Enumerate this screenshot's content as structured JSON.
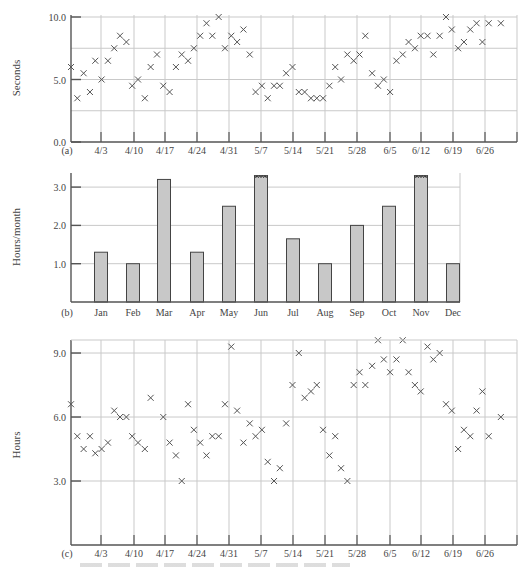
{
  "figure": {
    "caption_visible_text": ""
  },
  "chart_data": [
    {
      "panel": "(a)",
      "type": "scatter",
      "marker": "x",
      "title": "",
      "xlabel": "",
      "ylabel": "Seconds",
      "ylim": [
        0,
        10
      ],
      "yticks": [
        0.0,
        5.0,
        10.0
      ],
      "ytick_labels": [
        "0.0",
        "5.0",
        "10.0"
      ],
      "y_gridlines": [
        2.5,
        5.0,
        7.5,
        10.0
      ],
      "x_tick_labels": [
        "4/3",
        "4/10",
        "4/17",
        "4/24",
        "4/31",
        "5/7",
        "5/14",
        "5/21",
        "5/28",
        "6/5",
        "6/12",
        "6/19",
        "6/26"
      ],
      "x_range_days": [
        0,
        91
      ],
      "grid": true,
      "points": [
        {
          "day": 0,
          "y": 6.0
        },
        {
          "day": 1.3,
          "y": 3.5
        },
        {
          "day": 2.6,
          "y": 5.5
        },
        {
          "day": 3.9,
          "y": 4.0
        },
        {
          "day": 5.0,
          "y": 6.5
        },
        {
          "day": 6.3,
          "y": 5.0
        },
        {
          "day": 7.6,
          "y": 6.5
        },
        {
          "day": 8.9,
          "y": 7.5
        },
        {
          "day": 10.1,
          "y": 8.5
        },
        {
          "day": 11.4,
          "y": 8.0
        },
        {
          "day": 12.6,
          "y": 4.5
        },
        {
          "day": 13.8,
          "y": 5.0
        },
        {
          "day": 15.2,
          "y": 3.5
        },
        {
          "day": 16.4,
          "y": 6.0
        },
        {
          "day": 17.7,
          "y": 7.0
        },
        {
          "day": 19.0,
          "y": 4.5
        },
        {
          "day": 20.3,
          "y": 4.0
        },
        {
          "day": 21.6,
          "y": 6.0
        },
        {
          "day": 22.8,
          "y": 7.0
        },
        {
          "day": 24.1,
          "y": 6.5
        },
        {
          "day": 25.3,
          "y": 7.5
        },
        {
          "day": 26.6,
          "y": 8.5
        },
        {
          "day": 27.9,
          "y": 9.5
        },
        {
          "day": 29.1,
          "y": 8.5
        },
        {
          "day": 30.4,
          "y": 10.0
        },
        {
          "day": 31.7,
          "y": 7.5
        },
        {
          "day": 33.0,
          "y": 8.5
        },
        {
          "day": 34.2,
          "y": 8.0
        },
        {
          "day": 35.5,
          "y": 9.0
        },
        {
          "day": 36.8,
          "y": 7.0
        },
        {
          "day": 38.0,
          "y": 4.0
        },
        {
          "day": 39.3,
          "y": 4.5
        },
        {
          "day": 40.5,
          "y": 3.5
        },
        {
          "day": 41.8,
          "y": 4.5
        },
        {
          "day": 43.0,
          "y": 4.5
        },
        {
          "day": 44.3,
          "y": 5.5
        },
        {
          "day": 45.6,
          "y": 6.0
        },
        {
          "day": 46.9,
          "y": 4.0
        },
        {
          "day": 48.1,
          "y": 4.0
        },
        {
          "day": 49.4,
          "y": 3.5
        },
        {
          "day": 50.6,
          "y": 3.5
        },
        {
          "day": 51.9,
          "y": 3.5
        },
        {
          "day": 53.2,
          "y": 4.5
        },
        {
          "day": 54.4,
          "y": 6.0
        },
        {
          "day": 55.6,
          "y": 5.0
        },
        {
          "day": 56.9,
          "y": 7.0
        },
        {
          "day": 58.2,
          "y": 6.5
        },
        {
          "day": 59.4,
          "y": 7.0
        },
        {
          "day": 60.6,
          "y": 8.5
        },
        {
          "day": 62.0,
          "y": 5.5
        },
        {
          "day": 63.2,
          "y": 4.5
        },
        {
          "day": 64.4,
          "y": 5.0
        },
        {
          "day": 65.7,
          "y": 4.0
        },
        {
          "day": 67.0,
          "y": 6.5
        },
        {
          "day": 68.3,
          "y": 7.0
        },
        {
          "day": 69.5,
          "y": 8.0
        },
        {
          "day": 70.8,
          "y": 7.5
        },
        {
          "day": 72.0,
          "y": 8.5
        },
        {
          "day": 73.4,
          "y": 8.5
        },
        {
          "day": 74.6,
          "y": 7.0
        },
        {
          "day": 75.9,
          "y": 8.5
        },
        {
          "day": 77.2,
          "y": 10.0
        },
        {
          "day": 78.4,
          "y": 9.0
        },
        {
          "day": 79.7,
          "y": 7.5
        },
        {
          "day": 80.9,
          "y": 8.0
        },
        {
          "day": 82.2,
          "y": 9.0
        },
        {
          "day": 83.5,
          "y": 9.5
        },
        {
          "day": 84.7,
          "y": 8.0
        },
        {
          "day": 86.0,
          "y": 9.5
        },
        {
          "day": 88.5,
          "y": 9.5
        }
      ]
    },
    {
      "panel": "(b)",
      "type": "bar",
      "title": "",
      "xlabel": "",
      "ylabel": "Hours/month",
      "ylim": [
        0,
        3.35
      ],
      "yticks": [
        1.0,
        2.0,
        3.0
      ],
      "ytick_labels": [
        "1.0",
        "2.0",
        "3.0"
      ],
      "grid": true,
      "categories": [
        "Jan",
        "Feb",
        "Mar",
        "Apr",
        "May",
        "Jun",
        "Jul",
        "Aug",
        "Sep",
        "Oct",
        "Nov",
        "Dec"
      ],
      "values": [
        1.3,
        1.0,
        3.2,
        1.3,
        2.5,
        3.3,
        1.65,
        1.0,
        2.0,
        2.5,
        3.3,
        1.0
      ],
      "truncated": [
        false,
        false,
        false,
        false,
        false,
        true,
        false,
        false,
        false,
        false,
        true,
        false
      ],
      "bar_color": "#c8c8c8"
    },
    {
      "panel": "(c)",
      "type": "scatter",
      "marker": "x",
      "title": "",
      "xlabel": "",
      "ylabel": "Hours",
      "ylim": [
        0,
        9.6
      ],
      "yticks": [
        3.0,
        6.0,
        9.0
      ],
      "ytick_labels": [
        "3.0",
        "6.0",
        "9.0"
      ],
      "y_gridlines": [
        3.0,
        6.0,
        9.0
      ],
      "x_tick_labels": [
        "4/3",
        "4/10",
        "4/17",
        "4/24",
        "4/31",
        "5/7",
        "5/14",
        "5/21",
        "5/28",
        "6/5",
        "6/12",
        "6/19",
        "6/26"
      ],
      "x_range_days": [
        0,
        91
      ],
      "grid": true,
      "points": [
        {
          "day": 0,
          "y": 6.6
        },
        {
          "day": 1.3,
          "y": 5.1
        },
        {
          "day": 2.6,
          "y": 4.5
        },
        {
          "day": 3.9,
          "y": 5.1
        },
        {
          "day": 5.0,
          "y": 4.3
        },
        {
          "day": 6.3,
          "y": 4.5
        },
        {
          "day": 7.6,
          "y": 4.8
        },
        {
          "day": 8.9,
          "y": 6.3
        },
        {
          "day": 10.1,
          "y": 6.0
        },
        {
          "day": 11.4,
          "y": 6.0
        },
        {
          "day": 12.6,
          "y": 5.1
        },
        {
          "day": 13.8,
          "y": 4.8
        },
        {
          "day": 15.2,
          "y": 4.5
        },
        {
          "day": 16.4,
          "y": 6.9
        },
        {
          "day": 19.0,
          "y": 6.0
        },
        {
          "day": 20.3,
          "y": 4.8
        },
        {
          "day": 21.6,
          "y": 4.2
        },
        {
          "day": 22.8,
          "y": 3.0
        },
        {
          "day": 24.1,
          "y": 6.6
        },
        {
          "day": 25.3,
          "y": 5.4
        },
        {
          "day": 26.6,
          "y": 4.8
        },
        {
          "day": 27.9,
          "y": 4.2
        },
        {
          "day": 29.1,
          "y": 5.1
        },
        {
          "day": 30.4,
          "y": 5.1
        },
        {
          "day": 31.7,
          "y": 6.6
        },
        {
          "day": 33.0,
          "y": 9.3
        },
        {
          "day": 34.2,
          "y": 6.3
        },
        {
          "day": 35.5,
          "y": 4.8
        },
        {
          "day": 36.8,
          "y": 5.7
        },
        {
          "day": 38.0,
          "y": 5.1
        },
        {
          "day": 39.3,
          "y": 5.4
        },
        {
          "day": 40.5,
          "y": 3.9
        },
        {
          "day": 41.8,
          "y": 3.0
        },
        {
          "day": 43.0,
          "y": 3.6
        },
        {
          "day": 44.3,
          "y": 5.7
        },
        {
          "day": 45.6,
          "y": 7.5
        },
        {
          "day": 46.9,
          "y": 9.0
        },
        {
          "day": 48.1,
          "y": 6.9
        },
        {
          "day": 49.4,
          "y": 7.2
        },
        {
          "day": 50.6,
          "y": 7.5
        },
        {
          "day": 51.9,
          "y": 5.4
        },
        {
          "day": 53.2,
          "y": 4.2
        },
        {
          "day": 54.4,
          "y": 5.1
        },
        {
          "day": 55.6,
          "y": 3.6
        },
        {
          "day": 56.9,
          "y": 3.0
        },
        {
          "day": 58.2,
          "y": 7.5
        },
        {
          "day": 59.4,
          "y": 8.1
        },
        {
          "day": 60.6,
          "y": 7.5
        },
        {
          "day": 62.0,
          "y": 8.4
        },
        {
          "day": 63.2,
          "y": 9.6
        },
        {
          "day": 64.4,
          "y": 8.7
        },
        {
          "day": 65.7,
          "y": 8.1
        },
        {
          "day": 67.0,
          "y": 8.7
        },
        {
          "day": 68.3,
          "y": 9.6
        },
        {
          "day": 69.5,
          "y": 8.1
        },
        {
          "day": 70.8,
          "y": 7.5
        },
        {
          "day": 72.0,
          "y": 7.2
        },
        {
          "day": 73.4,
          "y": 9.3
        },
        {
          "day": 74.6,
          "y": 8.7
        },
        {
          "day": 75.9,
          "y": 9.0
        },
        {
          "day": 77.2,
          "y": 6.6
        },
        {
          "day": 78.4,
          "y": 6.3
        },
        {
          "day": 79.7,
          "y": 4.5
        },
        {
          "day": 80.9,
          "y": 5.4
        },
        {
          "day": 82.2,
          "y": 5.1
        },
        {
          "day": 83.5,
          "y": 6.3
        },
        {
          "day": 84.7,
          "y": 7.2
        },
        {
          "day": 86.0,
          "y": 5.1
        },
        {
          "day": 88.5,
          "y": 6.0
        }
      ]
    }
  ]
}
